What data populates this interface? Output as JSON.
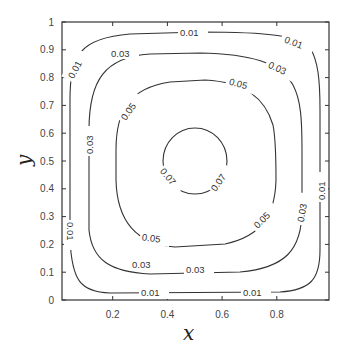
{
  "chart_data": {
    "type": "contour",
    "title": "",
    "xlabel": "x",
    "ylabel": "y",
    "xlim": [
      0,
      1
    ],
    "ylim": [
      0,
      1
    ],
    "grid": false,
    "legend": null,
    "x_ticks": [
      "0.2",
      "0.4",
      "0.6",
      "0.8"
    ],
    "x_tick_values": [
      0.2,
      0.4,
      0.6,
      0.8
    ],
    "y_ticks": [
      "0",
      "0.1",
      "0.2",
      "0.3",
      "0.4",
      "0.5",
      "0.6",
      "0.7",
      "0.8",
      "0.9",
      "1"
    ],
    "y_tick_values": [
      0,
      0.1,
      0.2,
      0.3,
      0.4,
      0.5,
      0.6,
      0.7,
      0.8,
      0.9,
      1.0
    ],
    "levels": [
      0.01,
      0.03,
      0.05,
      0.07
    ],
    "contours": [
      {
        "level": "0.01",
        "shape": "rounded square",
        "approx_bounds": {
          "x": [
            0.04,
            0.95
          ],
          "y": [
            0.03,
            0.96
          ]
        },
        "labels": [
          "0.01",
          "0.01",
          "0.01",
          "0.01",
          "0.01",
          "0.01",
          "0.01"
        ]
      },
      {
        "level": "0.03",
        "shape": "rounded square",
        "approx_bounds": {
          "x": [
            0.11,
            0.88
          ],
          "y": [
            0.1,
            0.89
          ]
        },
        "labels": [
          "0.03",
          "0.03",
          "0.03",
          "0.03",
          "0.03"
        ]
      },
      {
        "level": "0.05",
        "shape": "rounded square",
        "approx_bounds": {
          "x": [
            0.2,
            0.79
          ],
          "y": [
            0.2,
            0.79
          ]
        },
        "labels": [
          "0.05",
          "0.05",
          "0.05",
          "0.05"
        ]
      },
      {
        "level": "0.07",
        "shape": "circle",
        "center": [
          0.5,
          0.5
        ],
        "radius": 0.12,
        "labels": [
          "0.07",
          "0.07"
        ]
      }
    ]
  }
}
